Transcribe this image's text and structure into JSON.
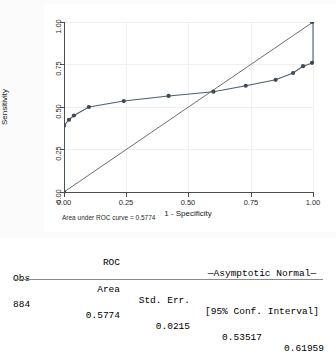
{
  "graph": {
    "y_axis_title": "Sensitivity",
    "x_axis_title": "1 - Specificity",
    "auc_note": "Area under ROC curve = 0.5774",
    "x_ticks": [
      "0.00",
      "0.25",
      "0.50",
      "0.75",
      "1.00"
    ],
    "y_ticks": [
      "0.00",
      "0.25",
      "0.50",
      "0.75",
      "1.00"
    ],
    "colors": {
      "curve": "#4d5e6e",
      "reference": "#55606b",
      "marker": "#3d4a57",
      "axis": "#4d4d4d",
      "grid": "#f0f0f0",
      "panel_background": "#fbfbfb",
      "plot_background": "#ffffff"
    }
  },
  "chart_data": {
    "type": "line",
    "title": "",
    "xlabel": "1 - Specificity",
    "ylabel": "Sensitivity",
    "xlim": [
      0,
      1
    ],
    "ylim": [
      0,
      1
    ],
    "grid": true,
    "legend": "none",
    "annotations": [
      "Area under ROC curve = 0.5774"
    ],
    "series": [
      {
        "name": "ROC curve",
        "markers": true,
        "x": [
          0.0,
          0.0,
          0.02,
          0.04,
          0.1,
          0.24,
          0.42,
          0.6,
          0.73,
          0.85,
          0.92,
          0.96,
          1.0,
          1.0
        ],
        "y": [
          0.0,
          0.39,
          0.425,
          0.45,
          0.5,
          0.535,
          0.565,
          0.59,
          0.625,
          0.66,
          0.7,
          0.74,
          0.76,
          1.0
        ]
      },
      {
        "name": "Reference line",
        "markers": false,
        "x": [
          0.0,
          1.0
        ],
        "y": [
          0.0,
          1.0
        ]
      }
    ]
  },
  "table": {
    "header_line1": {
      "roc": "ROC",
      "asymptotic": "—Asymptotic Normal—"
    },
    "header_line2": {
      "obs": "Obs",
      "area": "Area",
      "std_err": "Std. Err.",
      "conf_interval": "[95% Conf. Interval]"
    },
    "row": {
      "obs": "884",
      "area": "0.5774",
      "std_err": "0.0215",
      "ci_low": "0.53517",
      "ci_high": "0.61959"
    }
  }
}
